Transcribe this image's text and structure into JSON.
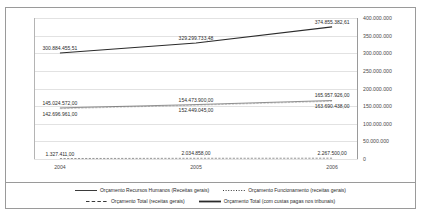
{
  "top_strip_text": "",
  "chart_data": {
    "type": "line",
    "title": "",
    "subtitle": "",
    "xlabel": "",
    "ylabel": "",
    "categories": [
      "2004",
      "2005",
      "2006"
    ],
    "x_tick_labels": [
      "2004",
      "2005",
      "2006"
    ],
    "y_tick_labels": [
      "400.000.000",
      "350.000.000",
      "300.000.000",
      "250.000.000",
      "200.000.000",
      "150.000.000",
      "100.000.000",
      "50.000.000",
      "0"
    ],
    "y_tick_values": [
      400000000,
      350000000,
      300000000,
      250000000,
      200000000,
      150000000,
      100000000,
      50000000,
      0
    ],
    "ylim": [
      0,
      400000000
    ],
    "grid": true,
    "y_axis_position": "right",
    "legend_position": "bottom",
    "series": [
      {
        "name": "Orçamento Recursos Humanos (Receitas gerais)",
        "style": "solid-thin",
        "color": "#3a3a3a",
        "values": [
          145024572.0,
          154473900.0,
          165957926.0
        ],
        "labels": [
          "145.024.572,00",
          "154.473.900,00",
          "165.957.926,00"
        ],
        "label_side": [
          "above",
          "above",
          "above"
        ]
      },
      {
        "name": "Orçamento Funcionamento (receitas gerais)",
        "style": "dotted",
        "color": "#3a3a3a",
        "values": [
          142696961.0,
          152449045.0,
          163690438.0
        ],
        "labels": [
          "142.696.961,00",
          "152.449.045,00",
          "163.690.438,00"
        ],
        "label_side": [
          "below",
          "below",
          "below"
        ]
      },
      {
        "name": "Orçamento Total (receitas gerais)",
        "style": "dashed",
        "color": "#3a3a3a",
        "values": [
          1327411.0,
          2034858.0,
          2267500.0
        ],
        "labels": [
          "1.327.411,00",
          "2.034.858,00",
          "2.267.500,00"
        ],
        "label_side": [
          "above",
          "above",
          "above"
        ]
      },
      {
        "name": "Orçamento Total (com custas pagas nos tribunais)",
        "style": "solid-thick",
        "color": "#2b2b2b",
        "values": [
          300884455.51,
          329299733.48,
          374855382.61
        ],
        "labels": [
          "300.884.455,51",
          "329.299.733,48",
          "374.855.382,61"
        ],
        "label_side": [
          "above",
          "above",
          "above"
        ]
      }
    ]
  }
}
